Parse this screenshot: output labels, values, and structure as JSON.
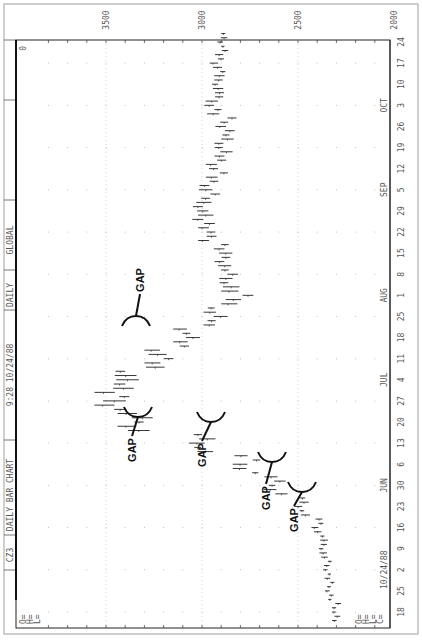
{
  "chart_data": {
    "type": "bar",
    "orientation": "rotated-90-clockwise",
    "title": "DAILY BAR CHART",
    "header": {
      "symbol": "CZ3",
      "chart_name": "DAILY BAR CHART",
      "timestamp": "9:28 10/24/88",
      "period": "DAILY",
      "source": "GLOBAL",
      "corner_value": "0"
    },
    "ohlc_legend": [
      "O=",
      "H=",
      "L=",
      "C="
    ],
    "left_legend": [
      "O=",
      "H=",
      "L="
    ],
    "date_label": "10/24/88",
    "price_axis": {
      "ticks": [
        "3500",
        "3000",
        "2500",
        "2000"
      ],
      "tick_values": [
        3500,
        3000,
        2500,
        2000
      ],
      "range": [
        2000,
        3800
      ]
    },
    "time_axis": {
      "months": [
        {
          "label": "JUN",
          "at_index": 6
        },
        {
          "label": "JUL",
          "at_index": 11
        },
        {
          "label": "AUG",
          "at_index": 15
        },
        {
          "label": "SEP",
          "at_index": 20
        },
        {
          "label": "OCT",
          "at_index": 24
        }
      ],
      "tick_labels": [
        "18",
        "25",
        "2",
        "9",
        "16",
        "23",
        "30",
        "6",
        "13",
        "20",
        "27",
        "4",
        "11",
        "18",
        "25",
        "1",
        "8",
        "15",
        "22",
        "29",
        "5",
        "12",
        "19",
        "26",
        "3",
        "10",
        "17",
        "24"
      ]
    },
    "series": [
      {
        "name": "weekly price (approx.)",
        "values": [
          2300,
          2330,
          2340,
          2360,
          2380,
          2470,
          2600,
          2760,
          2980,
          3300,
          3420,
          3370,
          3200,
          3050,
          2920,
          2800,
          2850,
          2870,
          2950,
          2980,
          2950,
          2910,
          2880,
          2860,
          2920,
          2900,
          2900,
          2880
        ],
        "ranges": [
          [
            2270,
            2330
          ],
          [
            2300,
            2360
          ],
          [
            2310,
            2370
          ],
          [
            2320,
            2400
          ],
          [
            2340,
            2430
          ],
          [
            2420,
            2520
          ],
          [
            2540,
            2680
          ],
          [
            2680,
            2840
          ],
          [
            2900,
            3080
          ],
          [
            3200,
            3440
          ],
          [
            3300,
            3560
          ],
          [
            3250,
            3500
          ],
          [
            3100,
            3300
          ],
          [
            2980,
            3150
          ],
          [
            2850,
            3000
          ],
          [
            2700,
            2900
          ],
          [
            2780,
            2920
          ],
          [
            2800,
            2940
          ],
          [
            2880,
            3020
          ],
          [
            2900,
            3060
          ],
          [
            2880,
            3020
          ],
          [
            2850,
            2980
          ],
          [
            2820,
            2950
          ],
          [
            2800,
            2930
          ],
          [
            2860,
            2990
          ],
          [
            2850,
            2960
          ],
          [
            2850,
            2960
          ],
          [
            2850,
            2920
          ]
        ]
      }
    ],
    "annotations": [
      {
        "text": "GAP",
        "at_index": 5
      },
      {
        "text": "GAP",
        "at_index": 6
      },
      {
        "text": "GAP",
        "at_index": 8
      },
      {
        "text": "GAP",
        "at_index": 9
      },
      {
        "text": "GAP",
        "at_index": 13
      }
    ],
    "grid": true,
    "legend": "none"
  }
}
